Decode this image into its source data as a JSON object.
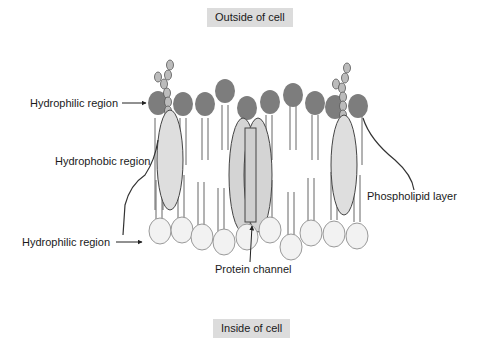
{
  "diagram": {
    "title_top": "Outside of cell",
    "title_bottom": "Inside of cell",
    "labels": {
      "hydrophilic_top": "Hydrophilic region",
      "hydrophobic": "Hydrophobic region",
      "hydrophilic_bottom": "Hydrophilic region",
      "phospholipid_layer": "Phospholipid layer",
      "protein_channel": "Protein channel"
    },
    "colors": {
      "head_outer": "#7d7d7d",
      "head_inner": "#f0f0f0",
      "protein_fill": "#d9d9d9",
      "stroke": "#555555",
      "label_bg": "#dcdcdc"
    }
  }
}
